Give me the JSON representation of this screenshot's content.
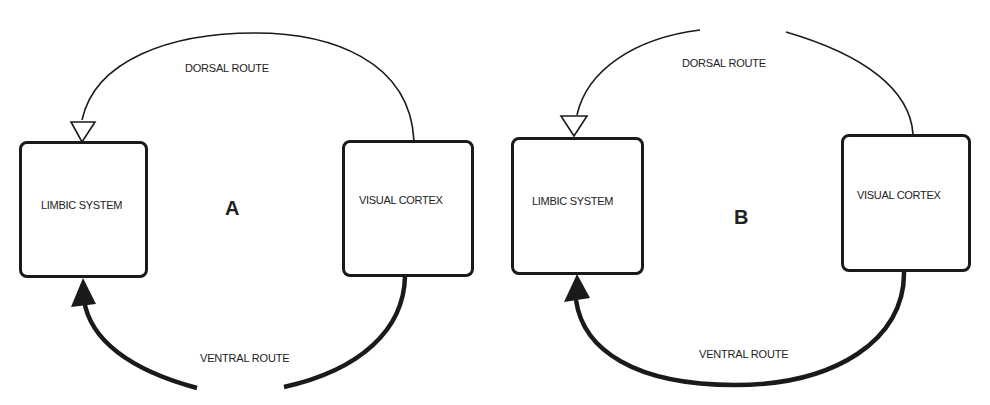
{
  "figure": {
    "panels": [
      {
        "id": "A",
        "letter": "A",
        "left_box": "LIMBIC SYSTEM",
        "right_box": "VISUAL CORTEX",
        "dorsal_label": "DORSAL ROUTE",
        "ventral_label": "VENTRAL ROUTE",
        "dorsal_state": "intact",
        "ventral_state": "interrupted"
      },
      {
        "id": "B",
        "letter": "B",
        "left_box": "LIMBIC SYSTEM",
        "right_box": "VISUAL CORTEX",
        "dorsal_label": "DORSAL ROUTE",
        "ventral_label": "VENTRAL ROUTE",
        "dorsal_state": "interrupted",
        "ventral_state": "intact"
      }
    ],
    "colors": {
      "ink": "#1a1a1a",
      "background": "#ffffff"
    }
  }
}
